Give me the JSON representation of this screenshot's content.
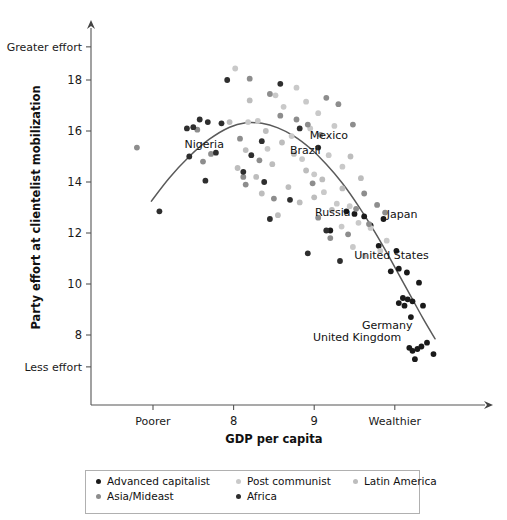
{
  "chart_data": {
    "type": "scatter",
    "title": "",
    "xlabel": "GDP per capita",
    "ylabel": "Party effort at clientelist mobilization",
    "xlim": [
      6.55,
      10.65
    ],
    "ylim": [
      6.55,
      19.4
    ],
    "grid": false,
    "xticks": [
      {
        "value": 7.0,
        "label": "Poorer"
      },
      {
        "value": 8.0,
        "label": "8"
      },
      {
        "value": 9.0,
        "label": "9"
      },
      {
        "value": 10.0,
        "label": "Wealthier"
      }
    ],
    "yticks": [
      {
        "value": 19.3,
        "label": "Greater effort"
      },
      {
        "value": 18.0,
        "label": "18"
      },
      {
        "value": 16.0,
        "label": "16"
      },
      {
        "value": 14.0,
        "label": "14"
      },
      {
        "value": 12.0,
        "label": "12"
      },
      {
        "value": 10.0,
        "label": "10"
      },
      {
        "value": 8.0,
        "label": "8"
      },
      {
        "value": 6.75,
        "label": "Less effort"
      }
    ],
    "legend_position": "bottom",
    "series": [
      {
        "name": "Advanced capitalist",
        "color": "#1a1a1a",
        "points": [
          [
            9.4,
            12.85
          ],
          [
            9.5,
            12.75
          ],
          [
            9.62,
            12.65
          ],
          [
            9.86,
            12.55
          ],
          [
            9.7,
            12.3
          ],
          [
            9.8,
            11.5
          ],
          [
            10.02,
            11.3
          ],
          [
            10.1,
            9.45
          ],
          [
            10.16,
            9.4
          ],
          [
            10.22,
            9.32
          ],
          [
            10.05,
            9.25
          ],
          [
            10.12,
            9.15
          ],
          [
            10.3,
            10.05
          ],
          [
            10.35,
            9.15
          ],
          [
            10.18,
            7.5
          ],
          [
            10.22,
            7.38
          ],
          [
            10.28,
            7.45
          ],
          [
            10.33,
            7.55
          ],
          [
            10.4,
            7.7
          ],
          [
            10.25,
            7.05
          ],
          [
            10.48,
            7.25
          ],
          [
            10.15,
            10.45
          ],
          [
            9.95,
            10.5
          ],
          [
            9.2,
            12.1
          ],
          [
            10.05,
            10.6
          ],
          [
            10.2,
            8.7
          ]
        ]
      },
      {
        "name": "Post communist",
        "color": "#c9c9c9",
        "points": [
          [
            8.02,
            18.45
          ],
          [
            8.52,
            17.4
          ],
          [
            8.78,
            17.7
          ],
          [
            8.9,
            17.15
          ],
          [
            8.62,
            16.95
          ],
          [
            8.3,
            16.4
          ],
          [
            8.18,
            16.35
          ],
          [
            9.05,
            16.7
          ],
          [
            8.95,
            16.1
          ],
          [
            8.72,
            15.8
          ],
          [
            9.18,
            15.05
          ],
          [
            9.35,
            14.6
          ],
          [
            9.12,
            13.6
          ],
          [
            9.28,
            13.15
          ],
          [
            9.44,
            13.05
          ],
          [
            9.55,
            12.4
          ],
          [
            9.34,
            12.25
          ],
          [
            9.7,
            12.2
          ],
          [
            9.48,
            11.45
          ],
          [
            9.62,
            11.1
          ],
          [
            9.82,
            11.3
          ],
          [
            9.9,
            11.7
          ],
          [
            8.42,
            15.3
          ],
          [
            9.0,
            14.3
          ],
          [
            9.25,
            16.2
          ],
          [
            8.85,
            14.9
          ]
        ]
      },
      {
        "name": "Latin America",
        "color": "#bdbdbd",
        "points": [
          [
            7.95,
            16.35
          ],
          [
            8.4,
            16.0
          ],
          [
            8.6,
            15.55
          ],
          [
            8.15,
            15.25
          ],
          [
            8.75,
            15.1
          ],
          [
            8.48,
            14.7
          ],
          [
            8.05,
            14.55
          ],
          [
            8.9,
            14.45
          ],
          [
            8.28,
            14.2
          ],
          [
            9.1,
            14.1
          ],
          [
            8.68,
            13.8
          ],
          [
            9.0,
            13.4
          ],
          [
            8.82,
            13.2
          ],
          [
            9.22,
            12.9
          ],
          [
            8.55,
            12.7
          ],
          [
            9.45,
            15.0
          ],
          [
            9.58,
            14.15
          ],
          [
            8.35,
            13.55
          ],
          [
            9.35,
            13.75
          ],
          [
            8.2,
            17.2
          ]
        ]
      },
      {
        "name": "Asia/Mideast",
        "color": "#8d8d8d",
        "points": [
          [
            6.8,
            15.35
          ],
          [
            7.55,
            16.05
          ],
          [
            7.72,
            15.1
          ],
          [
            7.62,
            14.8
          ],
          [
            8.08,
            15.7
          ],
          [
            8.12,
            14.2
          ],
          [
            8.15,
            13.9
          ],
          [
            8.32,
            14.85
          ],
          [
            8.45,
            17.45
          ],
          [
            8.58,
            16.6
          ],
          [
            8.78,
            16.45
          ],
          [
            8.92,
            16.25
          ],
          [
            9.08,
            15.85
          ],
          [
            9.15,
            17.3
          ],
          [
            9.3,
            17.05
          ],
          [
            9.48,
            16.25
          ],
          [
            9.62,
            13.55
          ],
          [
            9.78,
            13.1
          ],
          [
            9.52,
            12.95
          ],
          [
            9.68,
            12.35
          ],
          [
            8.2,
            18.05
          ],
          [
            8.98,
            13.95
          ],
          [
            9.42,
            11.95
          ],
          [
            9.88,
            12.8
          ],
          [
            9.05,
            12.6
          ],
          [
            9.2,
            11.8
          ],
          [
            8.5,
            13.35
          ]
        ]
      },
      {
        "name": "Africa",
        "color": "#2e2e2e",
        "points": [
          [
            7.08,
            12.85
          ],
          [
            7.42,
            16.1
          ],
          [
            7.5,
            16.15
          ],
          [
            7.58,
            16.45
          ],
          [
            7.68,
            16.35
          ],
          [
            7.85,
            16.3
          ],
          [
            7.78,
            15.15
          ],
          [
            7.65,
            14.05
          ],
          [
            7.92,
            18.0
          ],
          [
            8.22,
            15.05
          ],
          [
            8.38,
            14.0
          ],
          [
            8.12,
            14.4
          ],
          [
            8.82,
            16.1
          ],
          [
            9.05,
            15.35
          ],
          [
            8.35,
            15.6
          ],
          [
            7.45,
            15.0
          ],
          [
            8.7,
            13.3
          ],
          [
            8.45,
            12.55
          ],
          [
            9.15,
            12.1
          ],
          [
            8.92,
            11.2
          ],
          [
            8.58,
            17.85
          ],
          [
            9.32,
            10.9
          ]
        ]
      }
    ],
    "annotations": [
      {
        "text": "Nigeria",
        "x": 7.88,
        "y": 15.32
      },
      {
        "text": "Brazil",
        "x": 9.08,
        "y": 15.1
      },
      {
        "text": "Mexico",
        "x": 9.42,
        "y": 15.7
      },
      {
        "text": "Russia",
        "x": 9.45,
        "y": 12.65
      },
      {
        "text": "Japan",
        "x": 10.28,
        "y": 12.6
      },
      {
        "text": "United States",
        "x": 10.42,
        "y": 11.0
      },
      {
        "text": "Germany",
        "x": 10.22,
        "y": 8.25
      },
      {
        "text": "United Kingdom",
        "x": 10.08,
        "y": 7.75
      }
    ],
    "fit_curve": {
      "description": "quadratic lowess fit",
      "points": [
        [
          6.98,
          13.25
        ],
        [
          7.2,
          14.15
        ],
        [
          7.45,
          15.0
        ],
        [
          7.7,
          15.68
        ],
        [
          7.95,
          16.15
        ],
        [
          8.15,
          16.32
        ],
        [
          8.35,
          16.3
        ],
        [
          8.55,
          16.12
        ],
        [
          8.75,
          15.8
        ],
        [
          8.95,
          15.32
        ],
        [
          9.15,
          14.7
        ],
        [
          9.35,
          13.95
        ],
        [
          9.55,
          13.05
        ],
        [
          9.75,
          12.05
        ],
        [
          9.95,
          10.95
        ],
        [
          10.15,
          9.8
        ],
        [
          10.35,
          8.65
        ],
        [
          10.5,
          7.85
        ]
      ]
    }
  },
  "legend": {
    "entries": [
      {
        "label": "Advanced capitalist",
        "color": "#1a1a1a"
      },
      {
        "label": "Post communist",
        "color": "#c9c9c9"
      },
      {
        "label": "Latin America",
        "color": "#bdbdbd"
      },
      {
        "label": "Asia/Mideast",
        "color": "#8d8d8d"
      },
      {
        "label": "Africa",
        "color": "#2e2e2e"
      }
    ]
  }
}
